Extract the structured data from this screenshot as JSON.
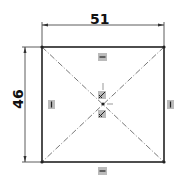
{
  "sketch": {
    "width_dimension": "51",
    "height_dimension": "46",
    "shape": "rectangle",
    "constructions": [
      "diagonal-centerline-1",
      "diagonal-centerline-2"
    ],
    "relations": {
      "top": "horizontal",
      "bottom": "horizontal",
      "left": "vertical",
      "right": "vertical",
      "center": "midpoint"
    }
  }
}
